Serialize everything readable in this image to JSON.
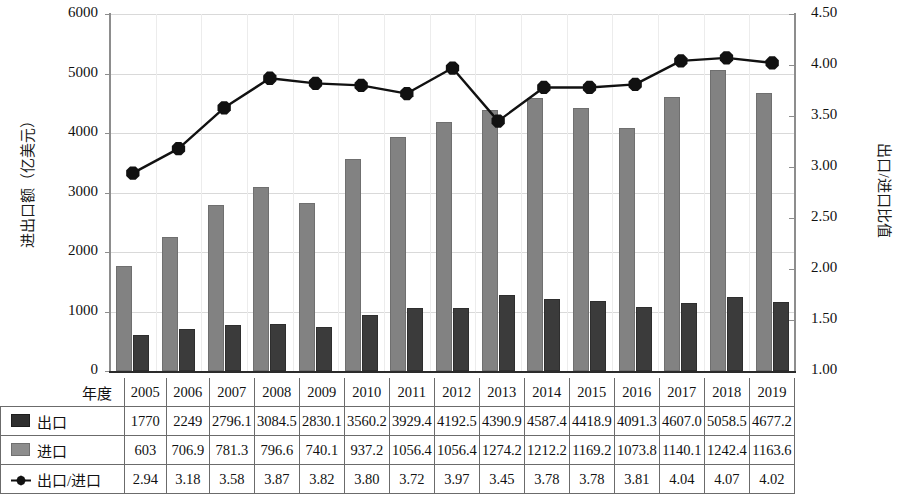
{
  "chart_data": {
    "type": "bar",
    "title": "",
    "xlabel": "年度",
    "ylabel": "进出口额（亿美元）",
    "y2label": "出口/进口比值",
    "ylim": [
      0,
      6000
    ],
    "y2lim": [
      1.0,
      4.5
    ],
    "ytick_step": 1000,
    "y2tick_step": 0.5,
    "grid": true,
    "legend_position": "table-row-labels",
    "categories": [
      "2005",
      "2006",
      "2007",
      "2008",
      "2009",
      "2010",
      "2011",
      "2012",
      "2013",
      "2014",
      "2015",
      "2016",
      "2017",
      "2018",
      "2019"
    ],
    "yticks": [
      "0",
      "1000",
      "2000",
      "3000",
      "4000",
      "5000",
      "6000"
    ],
    "y2ticks": [
      "1.00",
      "1.50",
      "2.00",
      "2.50",
      "3.00",
      "3.50",
      "4.00",
      "4.50"
    ],
    "series": [
      {
        "name": "出口",
        "kind": "bar",
        "axis": "left",
        "color": "#828282",
        "swatch_color": "#2f2f2f",
        "values": [
          1770,
          2249,
          2796.1,
          3084.5,
          2830.1,
          3560.2,
          3929.4,
          4192.5,
          4390.9,
          4587.4,
          4418.9,
          4091.3,
          4607.0,
          5058.5,
          4677.2
        ],
        "labels": [
          "1770",
          "2249",
          "2796.1",
          "3084.5",
          "2830.1",
          "3560.2",
          "3929.4",
          "4192.5",
          "4390.9",
          "4587.4",
          "4418.9",
          "4091.3",
          "4607.0",
          "5058.5",
          "4677.2"
        ]
      },
      {
        "name": "进口",
        "kind": "bar",
        "axis": "left",
        "color": "#3b3b3b",
        "swatch_color": "#8d8d8d",
        "values": [
          603,
          706.9,
          781.3,
          796.6,
          740.1,
          937.2,
          1056.4,
          1056.4,
          1274.2,
          1212.2,
          1169.2,
          1073.8,
          1140.1,
          1242.4,
          1163.6
        ],
        "labels": [
          "603",
          "706.9",
          "781.3",
          "796.6",
          "740.1",
          "937.2",
          "1056.4",
          "1056.4",
          "1274.2",
          "1212.2",
          "1169.2",
          "1073.8",
          "1140.1",
          "1242.4",
          "1163.6"
        ]
      },
      {
        "name": "出口/进口",
        "kind": "line",
        "axis": "right",
        "color": "#111111",
        "values": [
          2.94,
          3.18,
          3.58,
          3.87,
          3.82,
          3.8,
          3.72,
          3.97,
          3.45,
          3.78,
          3.78,
          3.81,
          4.04,
          4.07,
          4.02
        ],
        "labels": [
          "2.94",
          "3.18",
          "3.58",
          "3.87",
          "3.82",
          "3.80",
          "3.72",
          "3.97",
          "3.45",
          "3.78",
          "3.78",
          "3.81",
          "4.04",
          "4.07",
          "4.02"
        ]
      }
    ]
  }
}
